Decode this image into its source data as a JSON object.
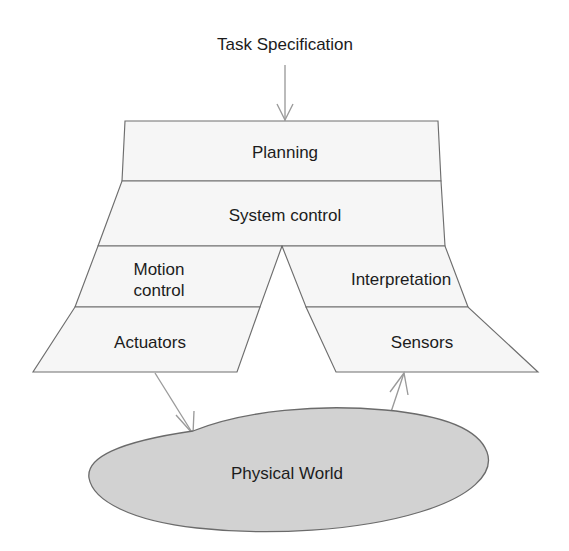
{
  "diagram": {
    "input_label": "Task Specification",
    "colors": {
      "band_fill": "#f6f6f6",
      "band_stroke": "#6e6e6e",
      "blob_fill": "#d2d2d2",
      "blob_stroke": "#6b6b6b",
      "arrow": "#9a9a9a",
      "text": "#1c1c1c",
      "background": "#ffffff"
    },
    "layers": [
      {
        "id": "planning",
        "label": "Planning",
        "span": "full"
      },
      {
        "id": "system-control",
        "label": "System control",
        "span": "full"
      },
      {
        "id": "motion-control",
        "label_line1": "Motion",
        "label_line2": "control",
        "label": "Motion control",
        "span": "left"
      },
      {
        "id": "interpretation",
        "label": "Interpretation",
        "span": "right"
      },
      {
        "id": "actuators",
        "label": "Actuators",
        "span": "left"
      },
      {
        "id": "sensors",
        "label": "Sensors",
        "span": "right"
      }
    ],
    "environment": {
      "label": "Physical World"
    },
    "arrows": [
      {
        "id": "task-input",
        "from": "Task Specification",
        "to": "Planning",
        "direction": "down"
      },
      {
        "id": "actuators-output",
        "from": "Actuators",
        "to": "Physical World",
        "direction": "down-right"
      },
      {
        "id": "sensors-input",
        "from": "Physical World",
        "to": "Sensors",
        "direction": "up-left"
      }
    ]
  }
}
